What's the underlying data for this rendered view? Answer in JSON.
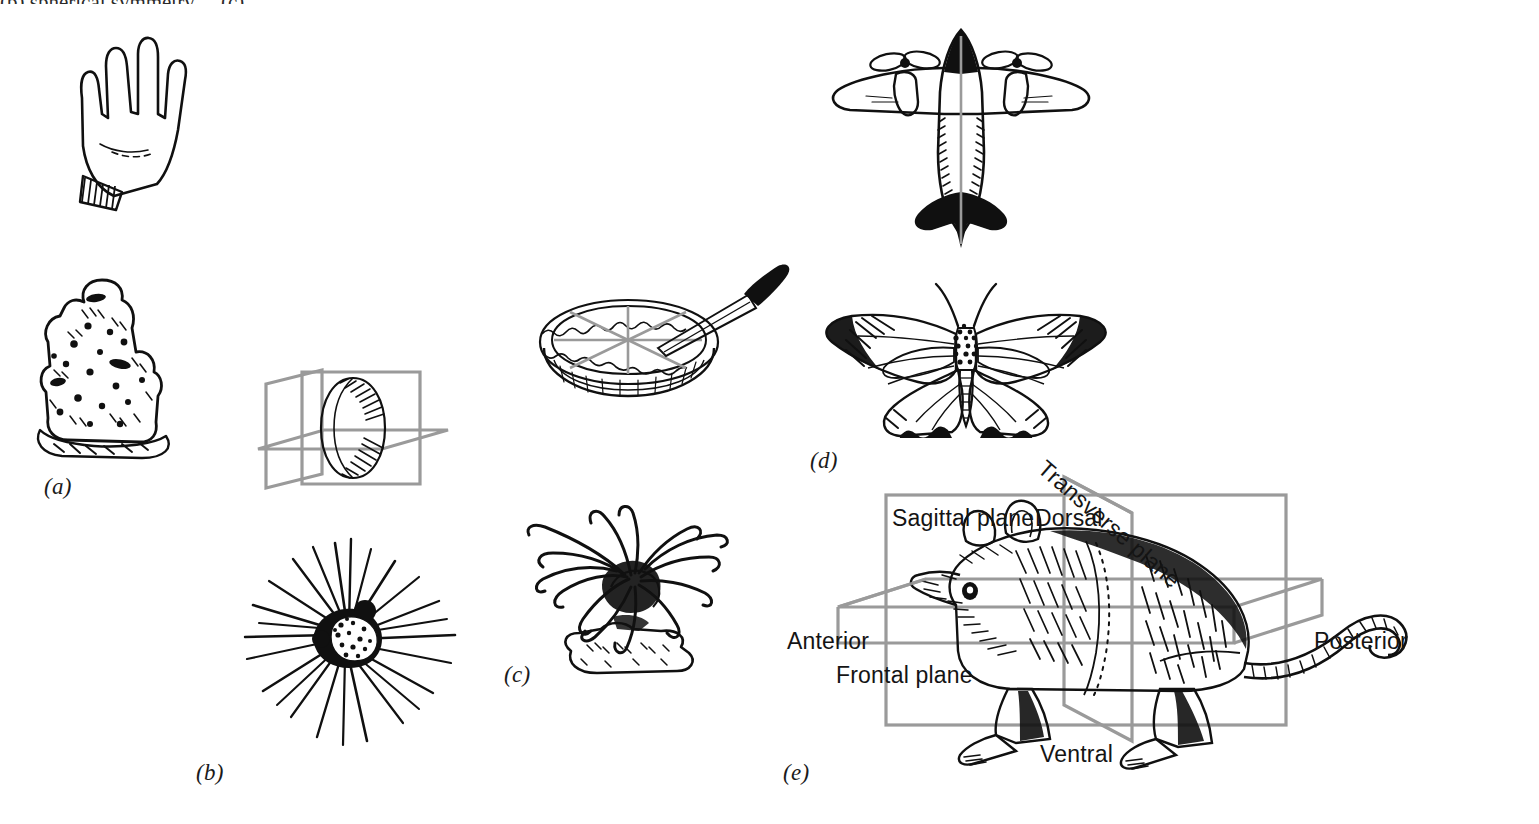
{
  "figure": {
    "title_partial": "(b) spherical symmetry ... (c)",
    "background": "#ffffff",
    "ink_color": "#101010",
    "plane_color": "#9a9a9a"
  },
  "panels": [
    {
      "id": "a",
      "label": "(a)",
      "subject": "sponge",
      "symmetry": "asymmetry"
    },
    {
      "id": "b",
      "label": "(b)",
      "subject": "heliozoan",
      "symmetry": "spherical"
    },
    {
      "id": "c",
      "label": "(c)",
      "subject": "sea-anemone",
      "symmetry": "radial"
    },
    {
      "id": "d",
      "label": "(d)",
      "subject": "moth",
      "symmetry": "bilateral"
    },
    {
      "id": "e",
      "label": "(e)",
      "subject": "mouse",
      "symmetry": "bilateral-planes"
    }
  ],
  "illustrations": [
    {
      "name": "hand",
      "caption": ""
    },
    {
      "name": "sponge",
      "caption": ""
    },
    {
      "name": "sphere-with-planes",
      "caption": ""
    },
    {
      "name": "heliozoan",
      "caption": ""
    },
    {
      "name": "pie-with-knife",
      "caption": ""
    },
    {
      "name": "sea-anemone",
      "caption": ""
    },
    {
      "name": "airplane",
      "caption": ""
    },
    {
      "name": "moth",
      "caption": ""
    },
    {
      "name": "mouse",
      "caption": ""
    }
  ],
  "mouse_diagram": {
    "labels": {
      "sagittal": "Sagittal plane",
      "dorsal": "Dorsal",
      "transverse": "Transverse plane",
      "anterior": "Anterior",
      "posterior": "Posterior",
      "frontal": "Frontal plane",
      "ventral": "Ventral"
    }
  }
}
